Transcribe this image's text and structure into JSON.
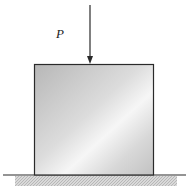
{
  "diagram": {
    "type": "compression-block-free-body",
    "load_label": "P",
    "colors": {
      "block_light": "#f4f4f4",
      "block_dark": "#b9b9b9",
      "outline": "#2a2a2a",
      "ground_hatch": "#c8c8c8"
    }
  }
}
